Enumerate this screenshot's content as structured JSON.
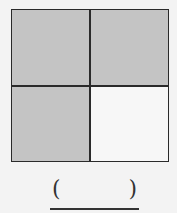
{
  "figure": {
    "grid": {
      "rows": 2,
      "cols": 2,
      "border_color": "#2a2a2a",
      "cells": [
        {
          "position": "top-left",
          "shaded": true,
          "color": "#c4c4c4"
        },
        {
          "position": "top-right",
          "shaded": true,
          "color": "#c4c4c4"
        },
        {
          "position": "bottom-left",
          "shaded": true,
          "color": "#c4c4c4"
        },
        {
          "position": "bottom-right",
          "shaded": false,
          "color": "#f7f7f7"
        }
      ]
    }
  },
  "answer": {
    "open_paren": "(",
    "close_paren": ")",
    "value": ""
  }
}
